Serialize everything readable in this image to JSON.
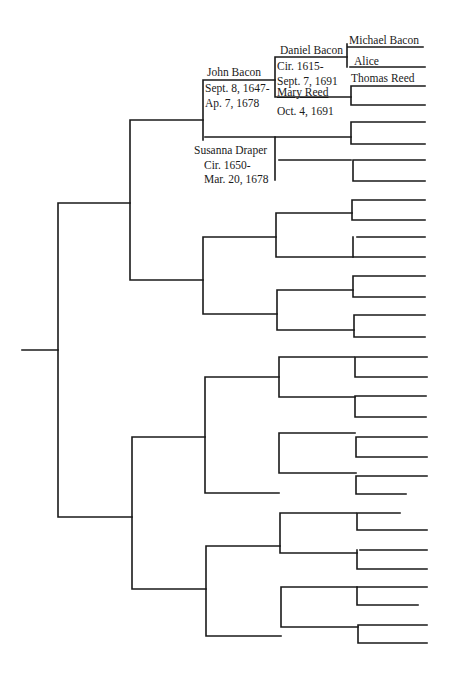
{
  "people": {
    "subject": {
      "name": "John Bacon",
      "born": "Sept. 8, 1647-",
      "died": "Ap. 7, 1678"
    },
    "spouse": {
      "name": "Susanna Draper",
      "born": "Cir. 1650-",
      "died": "Mar. 20, 1678"
    },
    "father": {
      "name": "Daniel Bacon",
      "born": "Cir. 1615-",
      "died": "Sept. 7, 1691"
    },
    "mother": {
      "name": "Mary Reed",
      "died": "Oct. 4, 1691"
    },
    "paternal_grandfather": {
      "name": "Michael Bacon"
    },
    "paternal_grandmother": {
      "name": "Alice"
    },
    "maternal_grandfather": {
      "name": "Thomas Reed"
    }
  },
  "line_color": "#1a1a1a",
  "background": "#ffffff"
}
